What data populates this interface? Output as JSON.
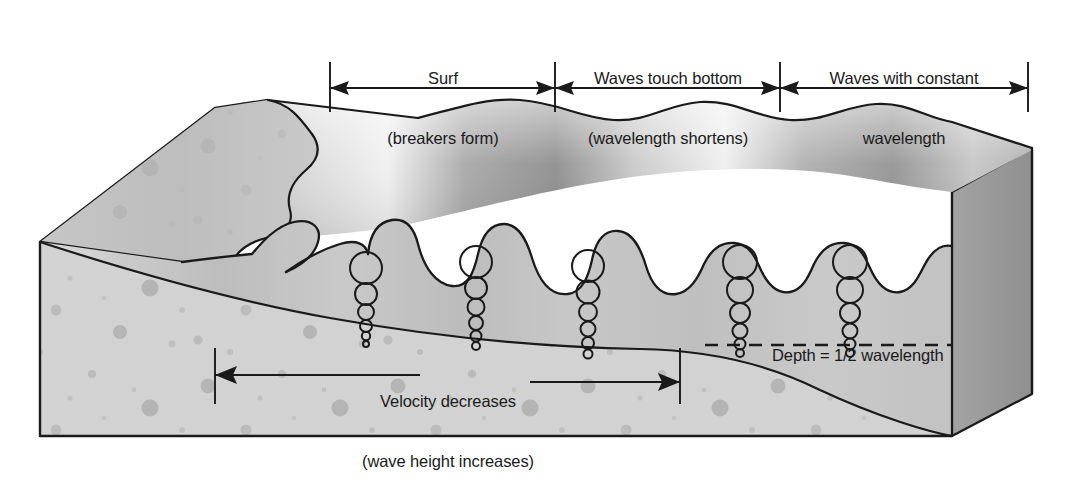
{
  "diagram": {
    "type": "block-diagram",
    "top_annotations": [
      {
        "id": "surf",
        "line1": "Surf",
        "line2": "(breakers form)",
        "arrow_start_x": 330,
        "arrow_end_x": 555,
        "arrow_y": 88,
        "arrow_heads": "both"
      },
      {
        "id": "waves-touch-bottom",
        "line1": "Waves touch bottom",
        "line2": "(wavelength shortens)",
        "arrow_start_x": 555,
        "arrow_end_x": 780,
        "arrow_y": 88,
        "arrow_heads": "both"
      },
      {
        "id": "waves-constant-wavelength",
        "line1": "Waves with constant",
        "line2": "wavelength",
        "arrow_start_x": 780,
        "arrow_end_x": 1028,
        "arrow_y": 88,
        "arrow_heads": "both"
      }
    ],
    "bottom_annotations": [
      {
        "id": "velocity",
        "line1": "Velocity decreases",
        "line2": "(wave height increases)",
        "arrow_start_x": 215,
        "arrow_end_x": 680,
        "arrow_y": 375,
        "arrow_heads": "both"
      }
    ],
    "depth_label": {
      "id": "depth-half-wavelength",
      "text": "Depth = 1/2 wavelength",
      "dashed_line_y": 345,
      "dashed_line_x_start": 705,
      "dashed_line_x_end": 952
    },
    "orbit_columns": [
      {
        "x": 366,
        "top_y": 264,
        "circle_count": 6,
        "top_radius": 16
      },
      {
        "x": 476,
        "top_y": 258,
        "circle_count": 6,
        "top_radius": 16
      },
      {
        "x": 588,
        "top_y": 262,
        "circle_count": 6,
        "top_radius": 16
      },
      {
        "x": 740,
        "top_y": 258,
        "circle_count": 6,
        "top_radius": 17
      },
      {
        "x": 850,
        "top_y": 258,
        "circle_count": 6,
        "top_radius": 17
      }
    ],
    "colors": {
      "ink": "#1a1a1a",
      "water_light": "#f2f2f2",
      "water_mid": "#b9b9b9",
      "water_dark": "#8d8d8d",
      "sand_face": "#cfcfcf",
      "sand_front": "#d4d4d4",
      "sand_speckle": "#a9a9a9",
      "block_side_dark": "#9a9a9a",
      "block_side_mid": "#b4b4b4",
      "white": "#ffffff"
    },
    "tick_marks_top_x": [
      330,
      555,
      780,
      1028
    ],
    "tick_marks_bottom_x": [
      215,
      680
    ]
  }
}
